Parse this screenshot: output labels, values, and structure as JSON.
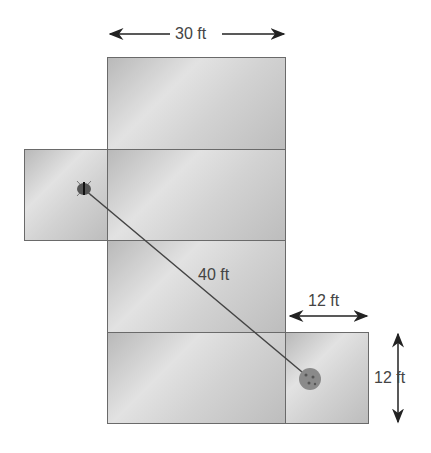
{
  "diagram": {
    "labels": {
      "top_width": "30 ft",
      "path_length": "40 ft",
      "flap_width": "12 ft",
      "flap_height": "12 ft"
    },
    "objects": {
      "start": "bug-icon",
      "end": "cookie-icon"
    },
    "colors": {
      "face_border": "#6a6a6a",
      "line": "#444444",
      "text": "#444444"
    }
  }
}
